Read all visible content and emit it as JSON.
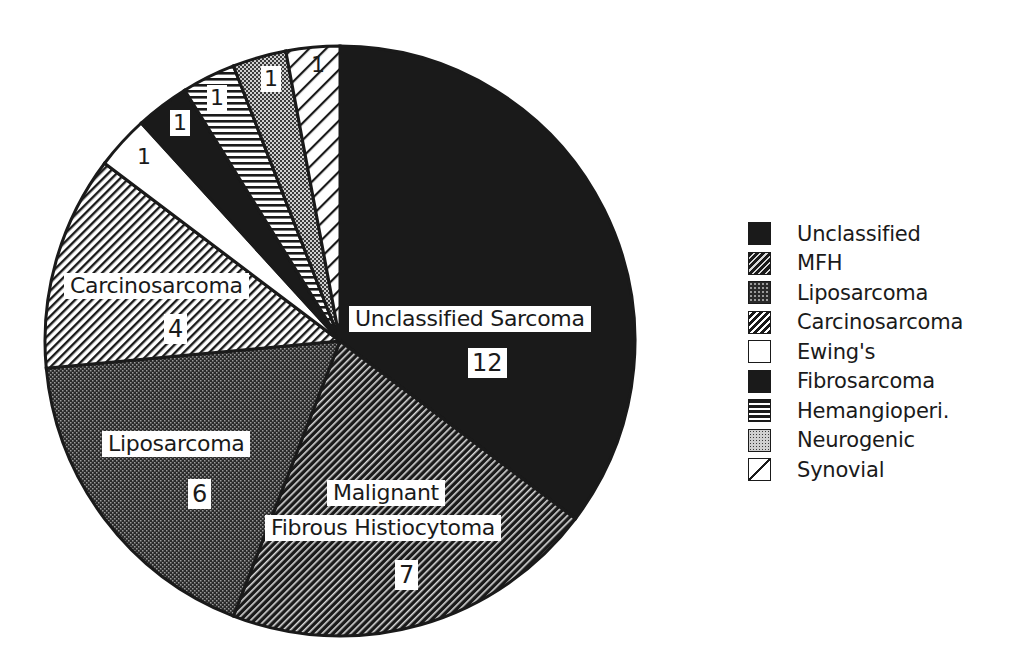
{
  "chart_data": {
    "type": "pie",
    "title": "",
    "total": 34,
    "start_angle_deg": 0,
    "direction": "clockwise",
    "slices": [
      {
        "name": "Unclassified",
        "label": "Unclassified Sarcoma",
        "value": 12,
        "pattern": "solid-dark"
      },
      {
        "name": "MFH",
        "label": "Malignant Fibrous Histiocytoma",
        "value": 7,
        "pattern": "diagonal-dense-dark"
      },
      {
        "name": "Liposarcoma",
        "label": "Liposarcoma",
        "value": 6,
        "pattern": "checker-dark"
      },
      {
        "name": "Carcinosarcoma",
        "label": "Carcinosarcoma",
        "value": 4,
        "pattern": "diagonal-light"
      },
      {
        "name": "Ewing's",
        "label": "",
        "value": 1,
        "pattern": "white"
      },
      {
        "name": "Fibrosarcoma",
        "label": "",
        "value": 1,
        "pattern": "solid-dark"
      },
      {
        "name": "Hemangioperi.",
        "label": "",
        "value": 1,
        "pattern": "horizontal-lines"
      },
      {
        "name": "Neurogenic",
        "label": "",
        "value": 1,
        "pattern": "checker-light"
      },
      {
        "name": "Synovial",
        "label": "",
        "value": 1,
        "pattern": "diagonal-sparse"
      }
    ],
    "legend": [
      "Unclassified",
      "MFH",
      "Liposarcoma",
      "Carcinosarcoma",
      "Ewing's",
      "Fibrosarcoma",
      "Hemangioperi.",
      "Neurogenic",
      "Synovial"
    ],
    "legend_position": "right"
  },
  "labels": {
    "unclassified_name": "Unclassified Sarcoma",
    "unclassified_count": "12",
    "mfh_name_line1": "Malignant",
    "mfh_name_line2": "Fibrous Histiocytoma",
    "mfh_count": "7",
    "lipo_name": "Liposarcoma",
    "lipo_count": "6",
    "carcino_name": "Carcinosarcoma",
    "carcino_count": "4",
    "ewing_count": "1",
    "fibro_count": "1",
    "hemangio_count": "1",
    "neuro_count": "1",
    "synovial_count": "1"
  },
  "legend": {
    "items": [
      {
        "label": "Unclassified"
      },
      {
        "label": "MFH"
      },
      {
        "label": "Liposarcoma"
      },
      {
        "label": "Carcinosarcoma"
      },
      {
        "label": "Ewing's"
      },
      {
        "label": "Fibrosarcoma"
      },
      {
        "label": "Hemangioperi."
      },
      {
        "label": "Neurogenic"
      },
      {
        "label": "Synovial"
      }
    ]
  },
  "colors": {
    "ink": "#1a1a1a",
    "paper": "#ffffff"
  }
}
